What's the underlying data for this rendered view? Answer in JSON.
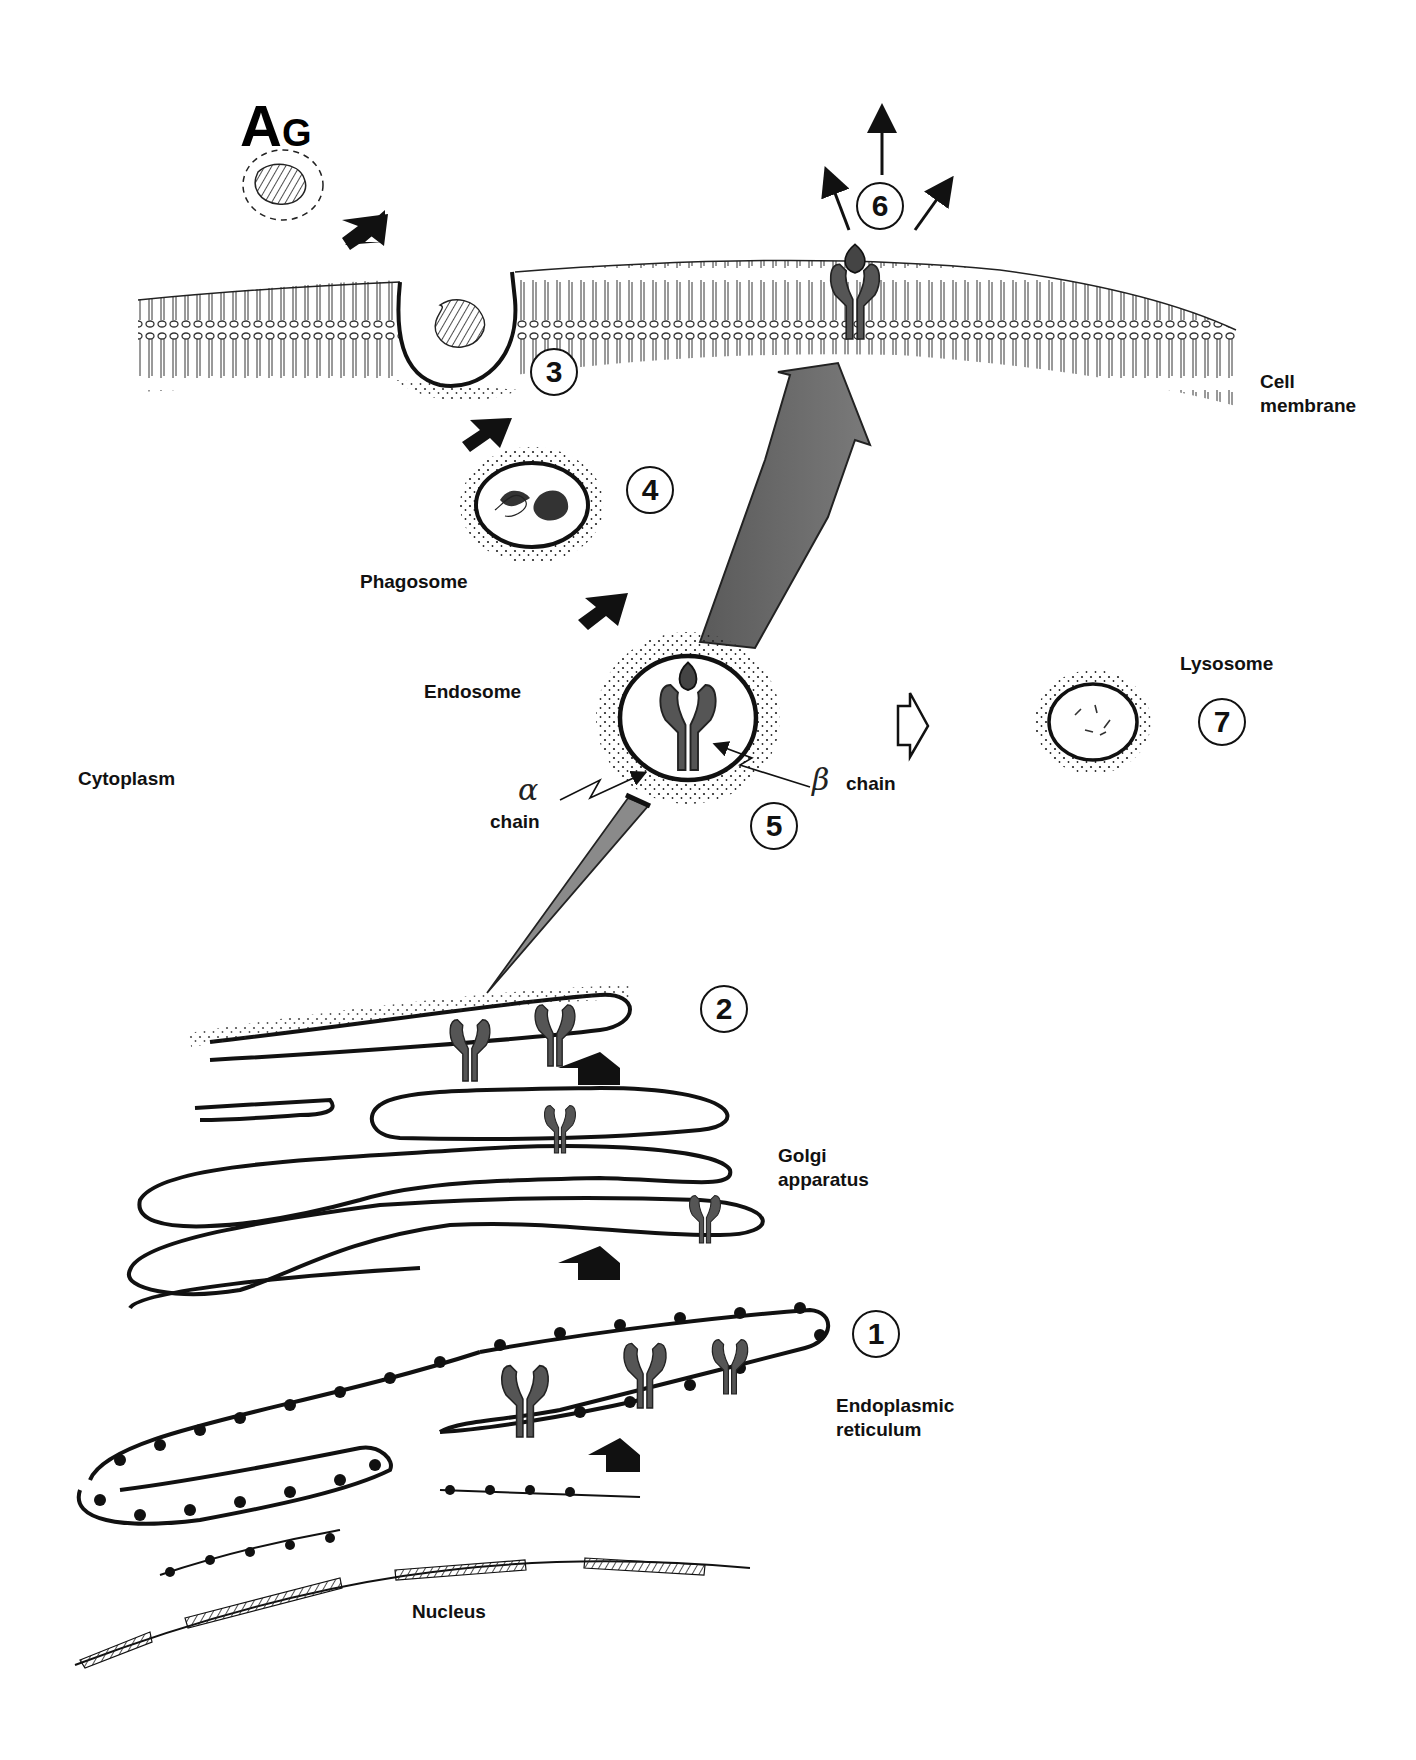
{
  "figure": {
    "type": "MHC class II antigen presentation pathway (hand-drawn)",
    "antigen_label": {
      "big": "A",
      "small": "G"
    },
    "labels": {
      "cell_membrane": "Cell\nmembrane",
      "phagosome": "Phagosome",
      "endosome": "Endosome",
      "lysosome": "Lysosome",
      "cytoplasm": "Cytoplasm",
      "alpha_chain": "chain",
      "beta_chain": "chain",
      "alpha_symbol": "α",
      "beta_symbol": "β",
      "golgi": "Golgi\napparatus",
      "er": "Endoplasmic\nreticulum",
      "nucleus": "Nucleus"
    },
    "steps": [
      {
        "n": "1",
        "meaning": "synthesis in endoplasmic reticulum"
      },
      {
        "n": "2",
        "meaning": "transport through Golgi apparatus"
      },
      {
        "n": "3",
        "meaning": "antigen uptake at cell membrane"
      },
      {
        "n": "4",
        "meaning": "phagosome"
      },
      {
        "n": "5",
        "meaning": "endosome peptide loading"
      },
      {
        "n": "6",
        "meaning": "presentation at cell surface"
      },
      {
        "n": "7",
        "meaning": "lysosome"
      }
    ],
    "colors": {
      "ink": "#111111",
      "protein_gray": "#555555",
      "arrow_gray": "#6e6e6e"
    }
  }
}
